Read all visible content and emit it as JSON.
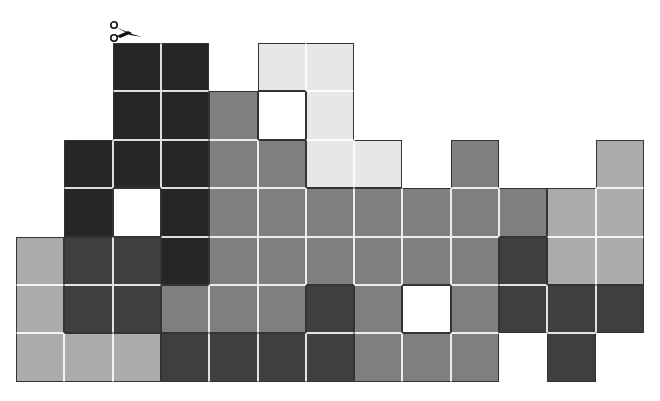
{
  "puzzle": {
    "type": "cut-the-grid puzzle",
    "icon": "scissors-icon",
    "grid_origin": {
      "x": 16,
      "y": 43
    },
    "cell_size": {
      "w": 48.3,
      "h": 48.4
    },
    "columns": 13,
    "rows": 7,
    "shade_colors": {
      "K": "#262626",
      "D": "#3f3f3f",
      "M": "#7f7f7f",
      "L": "#ababab",
      "P": "#e7e7e7",
      "W": "#ffffff"
    },
    "grid": [
      "__KK_PP______",
      "__KKMWP______",
      "_KKKMMPP_M__L",
      "_KWKMMMMMMMLL",
      "LDDKMMMMMMDLL",
      "LDDMMMDMWMDDD",
      "LLLDDDDMMM_D_"
    ]
  }
}
